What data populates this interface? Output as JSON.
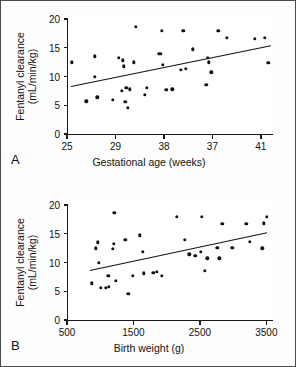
{
  "figure": {
    "background": "#fdfdfd",
    "point_color": "#111111",
    "line_color": "#111111"
  },
  "panels": [
    {
      "letter": "A",
      "ylabel_line1": "Fentanyl clearance",
      "ylabel_line2": "(mL/min/kg)",
      "xlabel": "Gestational age (weeks)"
    },
    {
      "letter": "B",
      "ylabel_line1": "Fentanyl clearance",
      "ylabel_line2": "(mL/min/kg)",
      "xlabel": "Birth weight (g)"
    }
  ],
  "chart_data": [
    {
      "type": "scatter",
      "panel": "A",
      "title": "",
      "xlabel": "Gestational age (weeks)",
      "ylabel": "Fentanyl clearance (mL/min/kg)",
      "xlim": [
        25,
        42
      ],
      "ylim": [
        0,
        20
      ],
      "xticks": [
        25,
        29,
        33,
        37,
        41
      ],
      "xtick_labels": [
        "25",
        "29",
        "38",
        "37",
        "41"
      ],
      "yticks": [
        0,
        5,
        10,
        15,
        20
      ],
      "ytick_labels": [
        "0",
        "5",
        "10",
        "15",
        "20"
      ],
      "grid": false,
      "legend": false,
      "points": [
        [
          25.4,
          12.5
        ],
        [
          26.6,
          5.7
        ],
        [
          27.3,
          13.5
        ],
        [
          27.3,
          10.0
        ],
        [
          27.5,
          6.4
        ],
        [
          28.8,
          5.9
        ],
        [
          29.3,
          13.2
        ],
        [
          29.5,
          7.5
        ],
        [
          29.6,
          12.8
        ],
        [
          29.7,
          11.8
        ],
        [
          29.8,
          5.6
        ],
        [
          29.9,
          8.0
        ],
        [
          30.0,
          4.6
        ],
        [
          30.2,
          7.8
        ],
        [
          30.5,
          12.5
        ],
        [
          30.7,
          18.6
        ],
        [
          31.4,
          6.8
        ],
        [
          31.6,
          8.0
        ],
        [
          32.6,
          13.9
        ],
        [
          32.7,
          13.9
        ],
        [
          32.8,
          18.0
        ],
        [
          32.9,
          12.0
        ],
        [
          33.2,
          7.7
        ],
        [
          33.7,
          7.8
        ],
        [
          34.4,
          11.2
        ],
        [
          34.6,
          17.9
        ],
        [
          34.8,
          11.3
        ],
        [
          35.4,
          14.7
        ],
        [
          36.5,
          8.6
        ],
        [
          36.6,
          13.3
        ],
        [
          36.7,
          12.5
        ],
        [
          36.9,
          10.7
        ],
        [
          37.5,
          17.9
        ],
        [
          38.2,
          16.7
        ],
        [
          40.5,
          16.6
        ],
        [
          41.3,
          16.7
        ],
        [
          41.6,
          12.4
        ]
      ],
      "fit_line": {
        "x": [
          25.3,
          41.8
        ],
        "y": [
          8.4,
          15.5
        ]
      }
    },
    {
      "type": "scatter",
      "panel": "B",
      "title": "",
      "xlabel": "Birth weight (g)",
      "ylabel": "Fentanyl clearance (mL/min/kg)",
      "xlim": [
        500,
        3600
      ],
      "ylim": [
        0,
        20
      ],
      "xticks": [
        500,
        1500,
        2500,
        3500
      ],
      "xtick_labels": [
        "500",
        "1500",
        "2500",
        "3500"
      ],
      "yticks": [
        0,
        5,
        10,
        15,
        20
      ],
      "ytick_labels": [
        "0",
        "5",
        "10",
        "15",
        "20"
      ],
      "grid": false,
      "legend": false,
      "points": [
        [
          870,
          6.4
        ],
        [
          930,
          12.5
        ],
        [
          960,
          13.5
        ],
        [
          980,
          10.0
        ],
        [
          1010,
          5.6
        ],
        [
          1080,
          5.6
        ],
        [
          1120,
          7.7
        ],
        [
          1130,
          5.8
        ],
        [
          1190,
          12.4
        ],
        [
          1200,
          13.2
        ],
        [
          1210,
          18.6
        ],
        [
          1230,
          6.8
        ],
        [
          1380,
          13.9
        ],
        [
          1420,
          4.6
        ],
        [
          1490,
          7.7
        ],
        [
          1600,
          14.7
        ],
        [
          1640,
          11.9
        ],
        [
          1660,
          8.1
        ],
        [
          1800,
          8.2
        ],
        [
          1850,
          8.4
        ],
        [
          1930,
          7.7
        ],
        [
          2150,
          17.9
        ],
        [
          2270,
          13.9
        ],
        [
          2340,
          11.4
        ],
        [
          2430,
          11.2
        ],
        [
          2510,
          11.9
        ],
        [
          2530,
          17.9
        ],
        [
          2570,
          8.6
        ],
        [
          2610,
          10.7
        ],
        [
          2760,
          12.6
        ],
        [
          2790,
          10.7
        ],
        [
          2840,
          16.7
        ],
        [
          2990,
          12.6
        ],
        [
          3200,
          16.7
        ],
        [
          3250,
          13.6
        ],
        [
          3440,
          12.5
        ],
        [
          3460,
          16.8
        ],
        [
          3510,
          18.0
        ]
      ],
      "fit_line": {
        "x": [
          850,
          3520
        ],
        "y": [
          8.7,
          15.3
        ]
      }
    }
  ]
}
